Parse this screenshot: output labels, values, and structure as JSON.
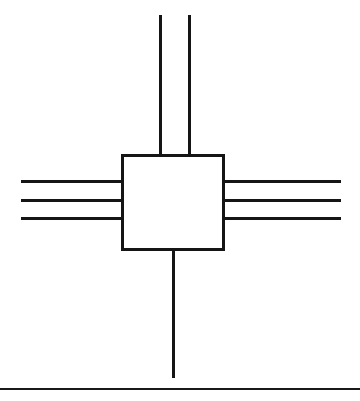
{
  "figure": {
    "name": "block-with-bus-connections",
    "canvas": {
      "width": 360,
      "height": 401
    },
    "background_color": "#ffffff",
    "ink_color": "#151515"
  },
  "block": {
    "name": "central-block",
    "shape": "rectangle",
    "x": 121,
    "y": 154,
    "width": 104,
    "height": 97,
    "stroke_width": 3,
    "fill": "#ffffff",
    "stroke": "#151515",
    "label": ""
  },
  "connections": {
    "top": {
      "name": "top-lines",
      "orientation": "vertical",
      "count": 2,
      "stroke_width": 3,
      "y_start": 15,
      "y_end": 155,
      "x_positions": [
        160,
        189
      ]
    },
    "left": {
      "name": "left-lines",
      "orientation": "horizontal",
      "count": 3,
      "stroke_width": 3,
      "x_start": 21,
      "x_end": 123,
      "y_positions": [
        181,
        200,
        218
      ]
    },
    "right": {
      "name": "right-lines",
      "orientation": "horizontal",
      "count": 3,
      "stroke_width": 3,
      "x_start": 223,
      "x_end": 341,
      "y_positions": [
        181,
        200,
        218
      ]
    },
    "bottom": {
      "name": "bottom-lines",
      "orientation": "vertical",
      "count": 1,
      "stroke_width": 3,
      "y_start": 250,
      "y_end": 378,
      "x_positions": [
        173
      ]
    }
  },
  "baseline_rule": {
    "name": "page-baseline-rule",
    "x_start": 0,
    "x_end": 360,
    "y": 389,
    "stroke_width": 2,
    "color": "#1a1a1a"
  },
  "caption": {
    "text": ""
  }
}
